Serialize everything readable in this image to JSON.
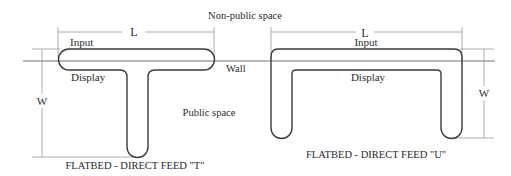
{
  "labels": {
    "non_public_space": "Non-public space",
    "public_space": "Public space",
    "wall": "Wall"
  },
  "t_layout": {
    "title": "FLATBED - DIRECT FEED \"T\"",
    "input": "Input",
    "display": "Display",
    "length_dim": "L",
    "width_dim": "W"
  },
  "u_layout": {
    "title": "FLATBED - DIRECT FEED \"U\"",
    "input": "Input",
    "display": "Display",
    "length_dim": "L",
    "width_dim": "W"
  },
  "colors": {
    "outline": "#3a3a3a",
    "wall": "#b8b8b8",
    "dimension": "#9a9a9a",
    "text": "#2a2a2a"
  }
}
